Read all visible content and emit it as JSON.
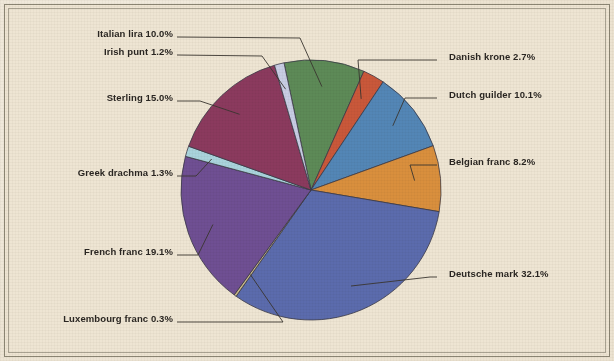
{
  "figure": {
    "background_color": "#ece3d1",
    "border_color": "#8b8573"
  },
  "chart_data": {
    "type": "pie",
    "title": "",
    "subtitle": "",
    "xlabel": "",
    "ylabel": "",
    "units": "percent",
    "legend_position": "callout-labels",
    "grid": false,
    "total": 100.0,
    "start_angle_deg": -12,
    "direction": "clockwise",
    "categories": [
      "Italian lira",
      "Danish krone",
      "Dutch guilder",
      "Belgian franc",
      "Deutsche mark",
      "Luxembourg franc",
      "French franc",
      "Greek drachma",
      "Sterling",
      "Irish punt"
    ],
    "values": [
      10.0,
      2.7,
      10.1,
      8.2,
      32.1,
      0.3,
      19.1,
      1.3,
      15.0,
      1.2
    ],
    "colors": [
      "#5d8a57",
      "#c9583a",
      "#5386b6",
      "#d98f3d",
      "#5b6bad",
      "#c9b98a",
      "#6f4f93",
      "#a9d3dc",
      "#8b3a5e",
      "#c8cde4"
    ],
    "labels": [
      "Italian lira 10.0%",
      "Danish krone 2.7%",
      "Dutch guilder 10.1%",
      "Belgian franc 8.2%",
      "Deutsche mark 32.1%",
      "Luxembourg franc 0.3%",
      "French franc 19.1%",
      "Greek drachma 1.3%",
      "Sterling 15.0%",
      "Irish punt 1.2%"
    ],
    "slices": [
      {
        "name": "Italian lira",
        "value": 10.0,
        "label": "Italian lira 10.0%",
        "color": "#5d8a57",
        "label_side": "left"
      },
      {
        "name": "Danish krone",
        "value": 2.7,
        "label": "Danish krone 2.7%",
        "color": "#c9583a",
        "label_side": "right"
      },
      {
        "name": "Dutch guilder",
        "value": 10.1,
        "label": "Dutch guilder 10.1%",
        "color": "#5386b6",
        "label_side": "right"
      },
      {
        "name": "Belgian franc",
        "value": 8.2,
        "label": "Belgian franc 8.2%",
        "color": "#d98f3d",
        "label_side": "right"
      },
      {
        "name": "Deutsche mark",
        "value": 32.1,
        "label": "Deutsche mark 32.1%",
        "color": "#5b6bad",
        "label_side": "right"
      },
      {
        "name": "Luxembourg franc",
        "value": 0.3,
        "label": "Luxembourg franc 0.3%",
        "color": "#c9b98a",
        "label_side": "left"
      },
      {
        "name": "French franc",
        "value": 19.1,
        "label": "French franc 19.1%",
        "color": "#6f4f93",
        "label_side": "left"
      },
      {
        "name": "Greek drachma",
        "value": 1.3,
        "label": "Greek drachma 1.3%",
        "color": "#a9d3dc",
        "label_side": "left"
      },
      {
        "name": "Sterling",
        "value": 15.0,
        "label": "Sterling 15.0%",
        "color": "#8b3a5e",
        "label_side": "left"
      },
      {
        "name": "Irish punt",
        "value": 1.2,
        "label": "Irish punt 1.2%",
        "color": "#c8cde4",
        "label_side": "left"
      }
    ]
  }
}
